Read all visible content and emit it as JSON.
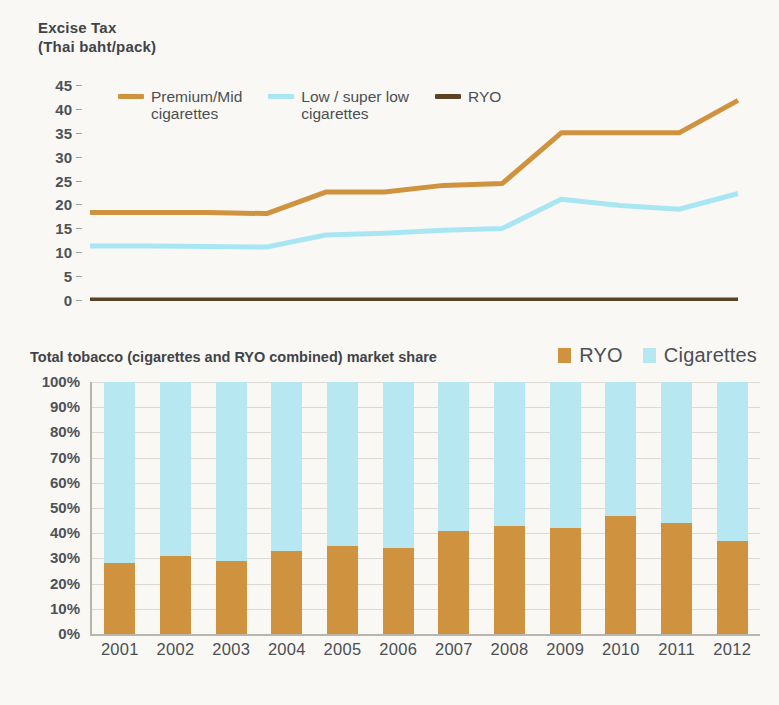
{
  "line_chart": {
    "title_line1": "Excise Tax",
    "title_line2": "(Thai baht/pack)",
    "legend": [
      {
        "label": "Premium/Mid\ncigarettes",
        "color": "#cf9340",
        "key": "premium-mid-cigarettes"
      },
      {
        "label": "Low / super low\ncigarettes",
        "color": "#a9e6f4",
        "key": "low-super-low-cigarettes"
      },
      {
        "label": "RYO",
        "color": "#5d4326",
        "key": "ryo"
      }
    ],
    "yticks": [
      "45",
      "40",
      "35",
      "30",
      "25",
      "20",
      "15",
      "10",
      "5",
      "0"
    ]
  },
  "bar_chart": {
    "title": "Total tobacco (cigarettes and RYO combined) market share",
    "legend": [
      {
        "label": "RYO",
        "color": "#cf9340",
        "key": "ryo"
      },
      {
        "label": "Cigarettes",
        "color": "#b7e8f2",
        "key": "cigarettes"
      }
    ],
    "yticks": [
      "100%",
      "90%",
      "80%",
      "70%",
      "60%",
      "50%",
      "40%",
      "30%",
      "20%",
      "10%",
      "0%"
    ]
  },
  "chart_data": [
    {
      "type": "line",
      "title": "Excise Tax (Thai baht/pack)",
      "xlabel": "",
      "ylabel": "Excise Tax (Thai baht/pack)",
      "ylim": [
        0,
        45
      ],
      "yticks": [
        0,
        5,
        10,
        15,
        20,
        25,
        30,
        35,
        40,
        45
      ],
      "grid": false,
      "legend_position": "top-left",
      "x": [
        2001,
        2002,
        2003,
        2004,
        2005,
        2006,
        2007,
        2008,
        2009,
        2010,
        2011,
        2012
      ],
      "series": [
        {
          "name": "Premium/Mid cigarettes",
          "color": "#cf9340",
          "values": [
            18.5,
            18.5,
            18.5,
            18.3,
            22.8,
            22.8,
            24.2,
            24.6,
            35.2,
            35.2,
            35.2,
            42.0
          ]
        },
        {
          "name": "Low / super low cigarettes",
          "color": "#a9e6f4",
          "values": [
            11.5,
            11.5,
            11.4,
            11.3,
            13.8,
            14.2,
            14.8,
            15.2,
            21.3,
            20.0,
            19.2,
            22.5
          ]
        },
        {
          "name": "RYO",
          "color": "#5d4326",
          "values": [
            0.1,
            0.1,
            0.1,
            0.1,
            0.1,
            0.1,
            0.1,
            0.1,
            0.1,
            0.1,
            0.1,
            0.1
          ]
        }
      ]
    },
    {
      "type": "bar",
      "subtype": "stacked-100",
      "title": "Total tobacco (cigarettes and RYO combined) market share",
      "xlabel": "",
      "ylabel": "",
      "ylim": [
        0,
        100
      ],
      "yticks": [
        0,
        10,
        20,
        30,
        40,
        50,
        60,
        70,
        80,
        90,
        100
      ],
      "grid": true,
      "legend_position": "top-right",
      "categories": [
        "2001",
        "2002",
        "2003",
        "2004",
        "2005",
        "2006",
        "2007",
        "2008",
        "2009",
        "2010",
        "2011",
        "2012"
      ],
      "series": [
        {
          "name": "RYO",
          "color": "#cf9340",
          "values": [
            28,
            31,
            29,
            33,
            35,
            34,
            41,
            43,
            42,
            47,
            44,
            37
          ]
        },
        {
          "name": "Cigarettes",
          "color": "#b7e8f2",
          "values": [
            72,
            69,
            71,
            67,
            65,
            66,
            59,
            57,
            58,
            53,
            56,
            63
          ]
        }
      ]
    }
  ]
}
